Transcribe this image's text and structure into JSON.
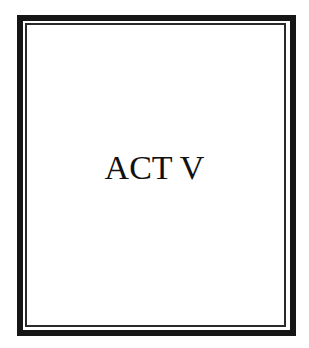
{
  "page": {
    "title": "ACT V",
    "colors": {
      "frame": "#161616",
      "inner_line": "#2a2a2a",
      "text": "#111111",
      "background": "#ffffff"
    }
  }
}
